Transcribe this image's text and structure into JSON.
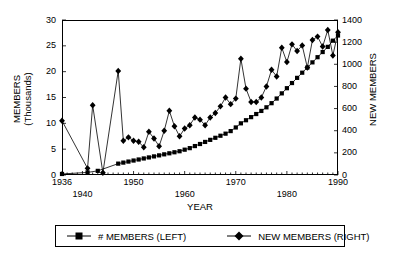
{
  "chart_data": {
    "type": "line",
    "title": "",
    "xlabel": "YEAR",
    "ylabel_left": "MEMBERS (Thousands)",
    "ylabel_right": "NEW MEMBERS",
    "xlim": [
      1936,
      1990
    ],
    "ylim_left": [
      0,
      30
    ],
    "ylim_right": [
      0,
      1400
    ],
    "x_ticks_major": [
      1936,
      1940,
      1950,
      1960,
      1970,
      1980,
      1990
    ],
    "x_tick_interval_minor": 1,
    "y_ticks_left": [
      0,
      5,
      10,
      15,
      20,
      25,
      30
    ],
    "y_ticks_right": [
      0,
      200,
      400,
      600,
      800,
      1000,
      1200,
      1400
    ],
    "grid": false,
    "legend_position": "below-plot",
    "series": [
      {
        "name": "# MEMBERS (LEFT)",
        "axis": "left",
        "marker": "square",
        "x": [
          1936,
          1941,
          1943,
          1947,
          1948,
          1949,
          1950,
          1951,
          1952,
          1953,
          1954,
          1955,
          1956,
          1957,
          1958,
          1959,
          1960,
          1961,
          1962,
          1963,
          1964,
          1965,
          1966,
          1967,
          1968,
          1969,
          1970,
          1971,
          1972,
          1973,
          1974,
          1975,
          1976,
          1977,
          1978,
          1979,
          1980,
          1981,
          1982,
          1983,
          1984,
          1985,
          1986,
          1987,
          1988,
          1989,
          1990
        ],
        "values": [
          0.2,
          0.5,
          0.8,
          2.2,
          2.4,
          2.6,
          2.8,
          3.0,
          3.2,
          3.4,
          3.6,
          3.8,
          4.0,
          4.2,
          4.4,
          4.6,
          4.9,
          5.2,
          5.6,
          6.0,
          6.4,
          6.8,
          7.2,
          7.6,
          8.0,
          8.5,
          9.2,
          10.0,
          10.6,
          11.2,
          11.8,
          12.4,
          13.1,
          13.9,
          14.8,
          15.8,
          16.8,
          17.8,
          18.8,
          19.8,
          20.8,
          21.8,
          22.8,
          23.8,
          24.8,
          26.0,
          27.0
        ]
      },
      {
        "name": "NEW MEMBERS (RIGHT)",
        "axis": "right",
        "marker": "diamond",
        "x": [
          1936,
          1941,
          1942,
          1944,
          1947,
          1948,
          1949,
          1950,
          1951,
          1952,
          1953,
          1954,
          1955,
          1956,
          1957,
          1958,
          1959,
          1960,
          1961,
          1962,
          1963,
          1964,
          1965,
          1966,
          1967,
          1968,
          1969,
          1970,
          1971,
          1972,
          1973,
          1974,
          1975,
          1976,
          1977,
          1978,
          1979,
          1980,
          1981,
          1982,
          1983,
          1984,
          1985,
          1986,
          1987,
          1988,
          1989,
          1990
        ],
        "values": [
          490,
          60,
          630,
          20,
          940,
          310,
          340,
          310,
          300,
          250,
          390,
          330,
          260,
          400,
          580,
          440,
          350,
          420,
          450,
          520,
          500,
          450,
          520,
          560,
          620,
          700,
          640,
          690,
          1050,
          780,
          660,
          660,
          700,
          800,
          950,
          890,
          1150,
          1020,
          1180,
          1120,
          1170,
          970,
          1220,
          1250,
          1160,
          1310,
          1080,
          1290
        ]
      }
    ]
  },
  "axis": {
    "left_label_line1": "MEMBERS",
    "left_label_line2": "(Thousands)",
    "right_label": "NEW MEMBERS",
    "x_label": "YEAR"
  },
  "legend": {
    "items": [
      {
        "label": "# MEMBERS (LEFT)",
        "marker": "square"
      },
      {
        "label": "NEW MEMBERS (RIGHT)",
        "marker": "diamond"
      }
    ]
  }
}
